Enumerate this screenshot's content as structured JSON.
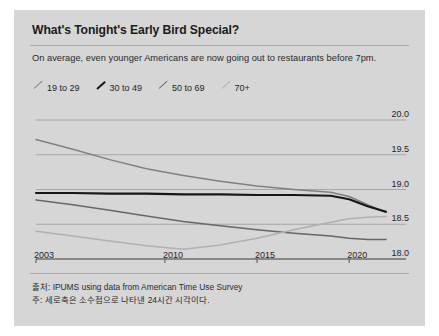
{
  "card": {
    "background": "#d6d6d6"
  },
  "header": {
    "title": "What's Tonight's Early Bird Special?",
    "subtitle": "On average, even younger Americans are now going out to restaurants before 7pm."
  },
  "footer": {
    "source": "출처: IPUMS using data from American Time Use Survey",
    "note": "주: 세로축은 소수점으로 나타낸 24시간 시각이다."
  },
  "chart_data": {
    "type": "line",
    "title": "What's Tonight's Early Bird Special?",
    "subtitle": "On average, even younger Americans are now going out to restaurants before 7pm.",
    "xlabel": "",
    "ylabel": "",
    "xlim": [
      2003,
      2022
    ],
    "ylim": [
      17.85,
      20.1
    ],
    "yticks": [
      18.0,
      18.5,
      19.0,
      19.5,
      20.0
    ],
    "ytick_labels": [
      "18.0",
      "18.5",
      "19.0",
      "19.5",
      "20.0"
    ],
    "xticks": [
      2003,
      2010,
      2015,
      2020
    ],
    "xtick_labels": [
      "2003",
      "2010",
      "2015",
      "2020"
    ],
    "grid": "horizontal",
    "legend_position": "top-left",
    "series": [
      {
        "name": "19 to 29",
        "color": "#808080",
        "width": 1.5,
        "x": [
          2003,
          2005,
          2007,
          2009,
          2011,
          2013,
          2015,
          2017,
          2019,
          2020,
          2021,
          2022
        ],
        "values": [
          19.72,
          19.58,
          19.43,
          19.3,
          19.2,
          19.12,
          19.05,
          19.0,
          18.96,
          18.9,
          18.78,
          18.67
        ]
      },
      {
        "name": "30 to 49",
        "color": "#161616",
        "width": 2.1,
        "x": [
          2003,
          2005,
          2007,
          2009,
          2011,
          2013,
          2015,
          2017,
          2019,
          2020,
          2021,
          2022
        ],
        "values": [
          18.95,
          18.95,
          18.94,
          18.94,
          18.93,
          18.93,
          18.92,
          18.92,
          18.91,
          18.86,
          18.76,
          18.68
        ]
      },
      {
        "name": "50 to 69",
        "color": "#676767",
        "width": 1.5,
        "x": [
          2003,
          2005,
          2007,
          2009,
          2011,
          2013,
          2015,
          2017,
          2019,
          2020,
          2021,
          2022
        ],
        "values": [
          18.85,
          18.78,
          18.7,
          18.62,
          18.54,
          18.48,
          18.42,
          18.37,
          18.33,
          18.3,
          18.28,
          18.28
        ]
      },
      {
        "name": "70+",
        "color": "#b0b0b0",
        "width": 1.5,
        "x": [
          2003,
          2005,
          2007,
          2009,
          2011,
          2013,
          2015,
          2017,
          2019,
          2020,
          2021,
          2022
        ],
        "values": [
          18.4,
          18.33,
          18.26,
          18.19,
          18.14,
          18.2,
          18.3,
          18.42,
          18.53,
          18.58,
          18.6,
          18.61
        ]
      }
    ]
  },
  "legend": {
    "items": [
      {
        "label": "19 to 29",
        "color": "#808080"
      },
      {
        "label": "30 to 49",
        "color": "#161616"
      },
      {
        "label": "50 to 69",
        "color": "#676767"
      },
      {
        "label": "70+",
        "color": "#b0b0b0"
      }
    ]
  }
}
